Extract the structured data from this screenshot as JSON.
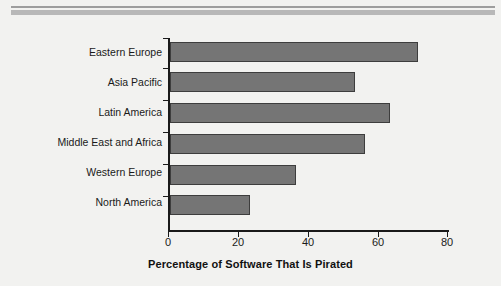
{
  "figure": {
    "background_color": "#f2f2f0",
    "rule_color": "#b8b8b8"
  },
  "chart_data": {
    "type": "bar",
    "orientation": "horizontal",
    "title": "",
    "xlabel": "Percentage of Software That Is Pirated",
    "ylabel": "",
    "categories": [
      "Eastern Europe",
      "Asia Pacific",
      "Latin America",
      "Middle East and Africa",
      "Western Europe",
      "North America"
    ],
    "values": [
      71,
      53,
      63,
      56,
      36,
      23
    ],
    "xlim": [
      0,
      80
    ],
    "xticks": [
      0,
      20,
      40,
      60,
      80
    ],
    "xtick_labels": [
      "0",
      "20",
      "40",
      "60",
      "80"
    ],
    "grid": false,
    "legend": null,
    "bar_fill_color": "#757575",
    "bar_edge_color": "#3d3d3d",
    "axis_color": "#1a1a1a"
  }
}
